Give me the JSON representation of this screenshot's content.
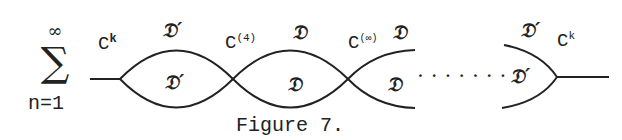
{
  "sum": {
    "upper": "∞",
    "symbol": "∑",
    "lower": "n=1"
  },
  "labels": {
    "c_k_left": {
      "base": "C",
      "sup": "k"
    },
    "d_prime_top_1": "𝔇′",
    "d_prime_bottom_1": "𝔇′",
    "c_4": {
      "base": "C",
      "sup": "(4)"
    },
    "d_top_2": "𝔇",
    "d_bottom_2": "𝔇",
    "c_inf": {
      "base": "C",
      "sup": "(∞)"
    },
    "d_top_3": "𝔇",
    "d_bottom_3": "𝔇",
    "dots": "· · · · · · ·",
    "d_prime_top_right": "𝔇′",
    "c_k_right": {
      "base": "C",
      "sup": "k"
    },
    "d_prime_bottom_right": "𝔇′"
  },
  "caption": "Figure 7.",
  "colors": {
    "ink": "#222222",
    "background": "#ffffff"
  }
}
